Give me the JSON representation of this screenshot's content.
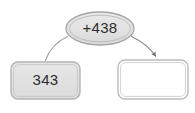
{
  "diagram": {
    "type": "function-machine",
    "background_color": "#ffffff",
    "operation_node": {
      "label": "+438",
      "shape": "ellipse",
      "fill_color": "#e2e2e2",
      "border_color": "#9a9a9a",
      "text_color": "#2e2e2e",
      "cx": 100,
      "cy": 28.5,
      "rx": 34,
      "ry": 16.5
    },
    "input_node": {
      "label": "343",
      "shape": "rounded-rectangle",
      "fill_color": "#e0e0e0",
      "border_color": "#a8a8a8",
      "text_color": "#2e2e2e",
      "x": 11,
      "y": 62,
      "width": 69,
      "height": 37
    },
    "output_node": {
      "label": "",
      "shape": "rounded-rectangle",
      "fill_color": "#ffffff",
      "border_color": "#b0b0b0",
      "text_color": "#2e2e2e",
      "x": 118,
      "y": 60,
      "width": 70,
      "height": 39
    },
    "connectors": [
      {
        "name": "input-to-operation",
        "from": "input_node",
        "to": "operation_node",
        "arrowhead": false,
        "color": "#a0a0a0"
      },
      {
        "name": "operation-to-output",
        "from": "operation_node",
        "to": "output_node",
        "arrowhead": true,
        "color": "#7a7a7a"
      }
    ]
  }
}
